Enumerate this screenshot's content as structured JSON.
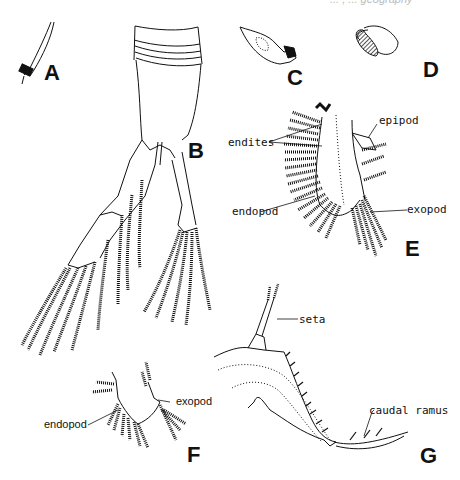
{
  "figure": {
    "clipped_header": "... , ... geography",
    "panels": [
      {
        "id": "A",
        "label": "A",
        "description": "seta tip"
      },
      {
        "id": "B",
        "label": "B",
        "description": "thoracic limb with two setose rami"
      },
      {
        "id": "C",
        "label": "C",
        "description": "mandible"
      },
      {
        "id": "D",
        "label": "D",
        "description": "setose lobe"
      },
      {
        "id": "E",
        "label": "E",
        "description": "phyllopod limb"
      },
      {
        "id": "F",
        "label": "F",
        "description": "small limb"
      },
      {
        "id": "G",
        "label": "G",
        "description": "caudal ramus"
      }
    ],
    "annotations": {
      "endites": "endites",
      "epipod": "epipod",
      "endopod_e": "endopod",
      "exopod_e": "exopod",
      "exopod_f": "exopod",
      "endopod_f": "endopod",
      "seta": "seta",
      "caudal_ramus": "caudal ramus"
    }
  }
}
